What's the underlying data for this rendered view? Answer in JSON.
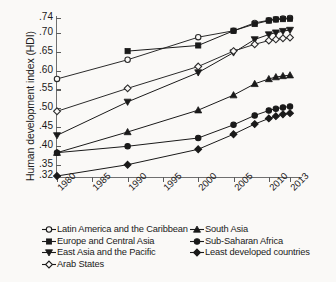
{
  "axis": {
    "ylabel": "Human development index (HDI)",
    "yticks": [
      ".74",
      ".70",
      ".65",
      ".60",
      ".55",
      ".50",
      ".45",
      ".40",
      ".35",
      ".32"
    ],
    "xticks": [
      "1980",
      "1985",
      "1990",
      "1995",
      "2000",
      "2005",
      "2010",
      "2013"
    ]
  },
  "legend": {
    "left": [
      {
        "label": "Latin America and the Caribbean",
        "marker": "open-circle-marker"
      },
      {
        "label": "Europe and Central Asia",
        "marker": "filled-square-marker"
      },
      {
        "label": "East Asia and the Pacific",
        "marker": "filled-triangle-down-marker"
      },
      {
        "label": "Arab States",
        "marker": "open-diamond-marker"
      }
    ],
    "right": [
      {
        "label": "South Asia",
        "marker": "filled-triangle-up-marker"
      },
      {
        "label": "Sub-Saharan Africa",
        "marker": "filled-circle-marker"
      },
      {
        "label": "Least developed countries",
        "marker": "filled-diamond-marker"
      }
    ]
  },
  "chart_data": {
    "type": "line",
    "title": "",
    "xlabel": "",
    "ylabel": "Human development index (HDI)",
    "xlim": [
      1980,
      2013
    ],
    "ylim": [
      0.32,
      0.74
    ],
    "ytick_values": [
      0.74,
      0.7,
      0.65,
      0.6,
      0.55,
      0.5,
      0.45,
      0.4,
      0.35,
      0.32
    ],
    "xtick_values": [
      1980,
      1985,
      1990,
      1995,
      2000,
      2005,
      2010,
      2013
    ],
    "grid": false,
    "legend_position": "below",
    "series": [
      {
        "name": "Latin America and the Caribbean",
        "marker": "open-circle",
        "color": "#2b2b2b",
        "x": [
          1980,
          1990,
          2000,
          2005,
          2008,
          2010,
          2011,
          2012,
          2013
        ],
        "values": [
          0.578,
          0.629,
          0.689,
          0.706,
          0.727,
          0.734,
          0.737,
          0.739,
          0.74
        ]
      },
      {
        "name": "Europe and Central Asia",
        "marker": "filled-square",
        "color": "#1a1a1a",
        "x": [
          1990,
          2000,
          2005,
          2008,
          2010,
          2011,
          2012,
          2013
        ],
        "values": [
          0.652,
          0.667,
          0.706,
          0.724,
          0.733,
          0.736,
          0.737,
          0.738
        ]
      },
      {
        "name": "East Asia and the Pacific",
        "marker": "filled-triangle-down",
        "color": "#1a1a1a",
        "x": [
          1980,
          1990,
          2000,
          2005,
          2008,
          2010,
          2011,
          2012,
          2013
        ],
        "values": [
          0.428,
          0.517,
          0.595,
          0.648,
          0.683,
          0.696,
          0.701,
          0.705,
          0.708
        ]
      },
      {
        "name": "Arab States",
        "marker": "open-diamond",
        "color": "#2b2b2b",
        "x": [
          1980,
          1990,
          2000,
          2005,
          2008,
          2010,
          2011,
          2012,
          2013
        ],
        "values": [
          0.492,
          0.553,
          0.611,
          0.652,
          0.67,
          0.68,
          0.683,
          0.686,
          0.688
        ]
      },
      {
        "name": "South Asia",
        "marker": "filled-triangle-up",
        "color": "#1a1a1a",
        "x": [
          1980,
          1990,
          2000,
          2005,
          2008,
          2010,
          2011,
          2012,
          2013
        ],
        "values": [
          0.382,
          0.437,
          0.495,
          0.535,
          0.565,
          0.578,
          0.583,
          0.586,
          0.588
        ]
      },
      {
        "name": "Sub-Saharan Africa",
        "marker": "filled-circle",
        "color": "#1a1a1a",
        "x": [
          1980,
          1990,
          2000,
          2005,
          2008,
          2010,
          2011,
          2012,
          2013
        ],
        "values": [
          0.382,
          0.399,
          0.421,
          0.456,
          0.481,
          0.494,
          0.499,
          0.502,
          0.505
        ]
      },
      {
        "name": "Least developed countries",
        "marker": "filled-diamond",
        "color": "#1a1a1a",
        "x": [
          1980,
          1990,
          2000,
          2005,
          2008,
          2010,
          2011,
          2012,
          2013
        ],
        "values": [
          0.32,
          0.35,
          0.391,
          0.431,
          0.458,
          0.473,
          0.479,
          0.484,
          0.487
        ]
      }
    ]
  }
}
